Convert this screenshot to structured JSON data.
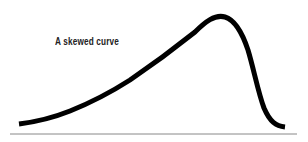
{
  "diagram": {
    "label": "A skewed curve",
    "curve_description": "right-skewed distribution curve with long left tail and steep right drop",
    "colors": {
      "curve": "#000000",
      "baseline": "#888888",
      "text": "#222222"
    }
  }
}
